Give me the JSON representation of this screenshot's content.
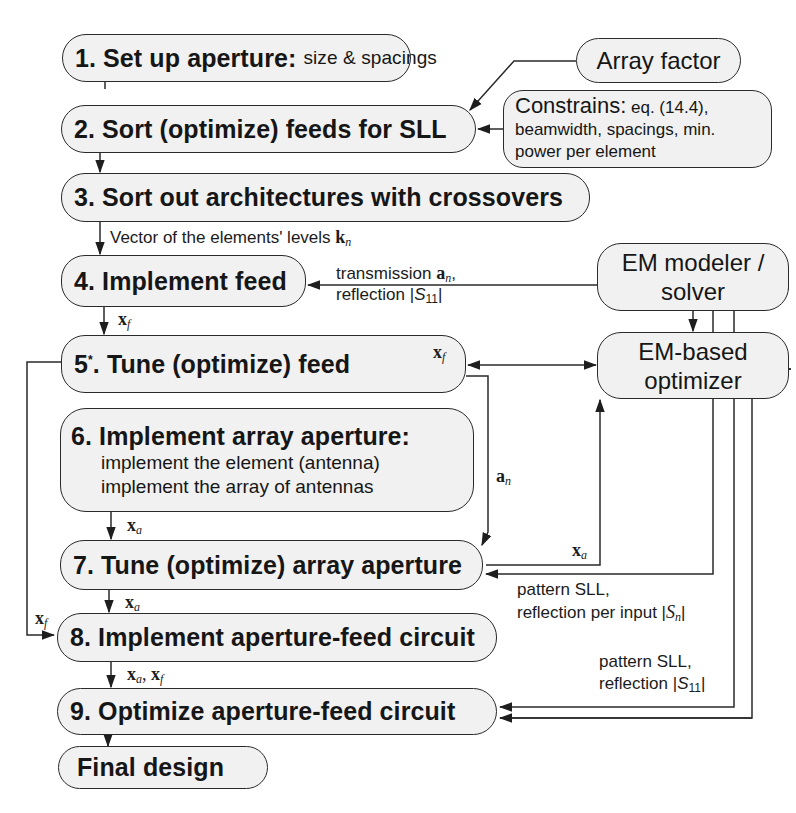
{
  "diagram": {
    "type": "flowchart",
    "steps": [
      {
        "id": "1",
        "title": "1. Set up aperture:",
        "detail": "size & spacings"
      },
      {
        "id": "2",
        "title": "2. Sort (optimize) feeds for SLL"
      },
      {
        "id": "3",
        "title": "3. Sort out architectures with crossovers"
      },
      {
        "id": "4",
        "title": "4. Implement feed"
      },
      {
        "id": "5",
        "title_num": "5",
        "title_star": "*",
        "title_rest": ". Tune (optimize) feed"
      },
      {
        "id": "6",
        "title": "6. Implement array aperture:",
        "details": [
          "implement the element (antenna)",
          "implement the array of antennas"
        ]
      },
      {
        "id": "7",
        "title": "7. Tune (optimize) array aperture"
      },
      {
        "id": "8",
        "title": "8. Implement aperture-feed circuit"
      },
      {
        "id": "9",
        "title": "9. Optimize aperture-feed circuit"
      },
      {
        "id": "final",
        "title": "Final design"
      }
    ],
    "side_boxes": {
      "array_factor": "Array factor",
      "constrains": {
        "head": "Constrains:",
        "line1": "eq. (14.4),",
        "line2": "beamwidth, spacings, min.",
        "line3": "power per element"
      },
      "em_modeler": {
        "line1": "EM modeler /",
        "line2": "solver"
      },
      "em_optimizer": {
        "line1": "EM-based",
        "line2": "optimizer"
      }
    },
    "edge_labels": {
      "levels_text": "Vector of the elements' levels ",
      "levels_sym": "k",
      "levels_sub": "n",
      "transmission_text": "transmission ",
      "transmission_sym": "a",
      "transmission_sub": "n",
      "transmission_tail": ",",
      "reflection_text": "reflection |",
      "reflection_sym": "S",
      "reflection_sub": "11",
      "reflection_tail": "|",
      "xf_sym": "x",
      "xf_sub": "f",
      "xa_sym": "x",
      "xa_sub": "a",
      "an_sym": "a",
      "an_sub": "n",
      "pattern_sll": "pattern SLL,",
      "refl_per_input_text": "reflection per input |",
      "refl_per_input_sym": "S",
      "refl_per_input_sub": "n",
      "refl_per_input_tail": "|",
      "refl11_text": "reflection |",
      "refl11_sym": "S",
      "refl11_sub": "11",
      "refl11_tail": "|",
      "xa_xf_sep": ", "
    },
    "colors": {
      "box_fill": "#f1f1f1",
      "stroke": "#2a2a2a",
      "background": "#ffffff"
    }
  }
}
